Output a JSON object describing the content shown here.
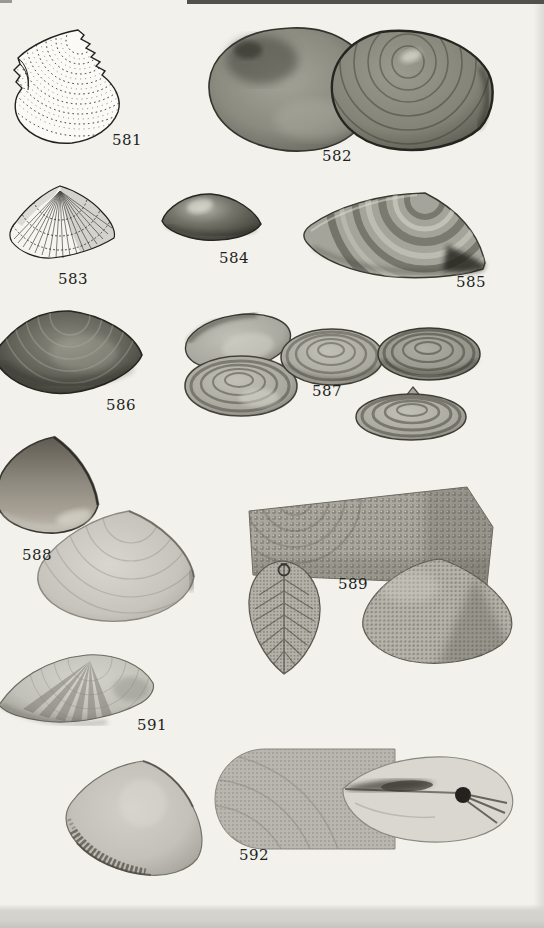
{
  "plate": {
    "title": "shell-specimen-plate",
    "palette": {
      "paper": "#f2f1ec",
      "ink": "#211f1c",
      "shell_dark": "#3b3b34",
      "shell_mid": "#8f8e84",
      "shell_light": "#cac8c0",
      "bottom_band": "#d2d1cb",
      "top_strip": "#53514c"
    }
  },
  "figures": [
    {
      "caption": "581",
      "kind": "line-engraving",
      "subject": "ribbed clam shell, concentric dashed growth lines, serrated dorsal edge"
    },
    {
      "caption": "582",
      "kind": "photograph",
      "subject": "two overlapping dark oval clam shells, exterior views"
    },
    {
      "caption": "583",
      "kind": "line-engraving",
      "subject": "triangular shell with fine radial ribs"
    },
    {
      "caption": "584",
      "kind": "photograph",
      "subject": "small dark wedge-shaped shell with highlight"
    },
    {
      "caption": "585",
      "kind": "photograph",
      "subject": "elongated shell with alternating light and dark concentric bands, pointed posterior"
    },
    {
      "caption": "586",
      "kind": "photograph",
      "subject": "dark elongated oval shell, partially cropped at left edge"
    },
    {
      "caption": "587",
      "kind": "photograph-group",
      "subject": "five ringed tellin shells, two overlapping at left, one center, one right, one lower right"
    },
    {
      "caption": "588",
      "kind": "photograph-group",
      "subject": "dark triangular shell above a large pale triangular shell"
    },
    {
      "caption": "589",
      "kind": "photograph-group",
      "subject": "magnified pustulose surface patch, vertical dorsal view with tag ring, and beaded triangular shell"
    },
    {
      "caption": "591",
      "kind": "photograph",
      "subject": "pale elongated shell with dark radial rays"
    },
    {
      "caption": "592",
      "kind": "photograph-group",
      "subject": "ribbed triangular shell, magnified sculpture patch, and pale dorsal view with dark ligament"
    }
  ]
}
